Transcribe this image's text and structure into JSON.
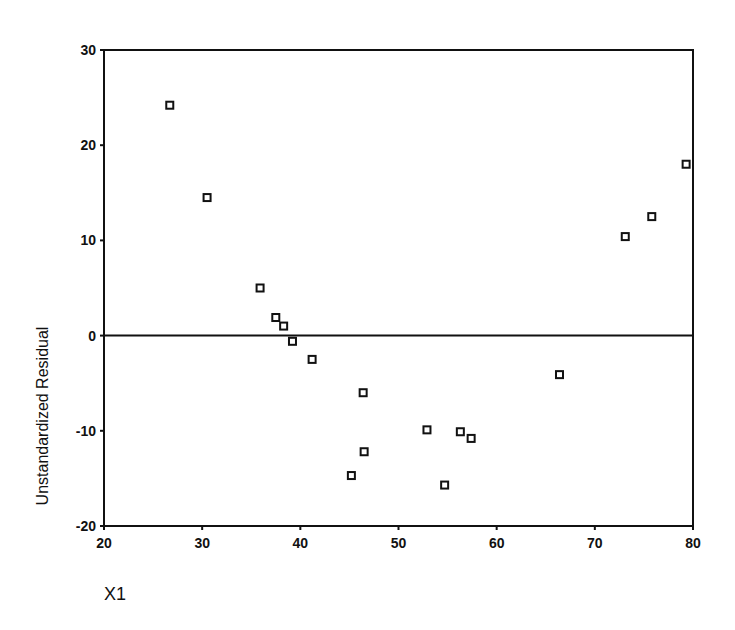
{
  "chart_data": {
    "type": "scatter",
    "title": "",
    "xlabel": "X1",
    "ylabel": "Unstandardized Residual",
    "xlim": [
      20,
      80
    ],
    "ylim": [
      -20,
      30
    ],
    "xticks": [
      20,
      30,
      40,
      50,
      60,
      70,
      80
    ],
    "yticks": [
      30,
      20,
      10,
      0,
      -10,
      -20
    ],
    "grid": false,
    "legend": null,
    "reference_line": {
      "y": 0
    },
    "marker": "hollow-square",
    "series": [
      {
        "name": "Residuals",
        "points": [
          {
            "x": 26.7,
            "y": 24.2
          },
          {
            "x": 30.5,
            "y": 14.5
          },
          {
            "x": 35.9,
            "y": 5.0
          },
          {
            "x": 37.5,
            "y": 1.9
          },
          {
            "x": 38.3,
            "y": 1.0
          },
          {
            "x": 39.2,
            "y": -0.6
          },
          {
            "x": 41.2,
            "y": -2.5
          },
          {
            "x": 45.2,
            "y": -14.7
          },
          {
            "x": 46.4,
            "y": -6.0
          },
          {
            "x": 46.5,
            "y": -12.2
          },
          {
            "x": 52.9,
            "y": -9.9
          },
          {
            "x": 54.7,
            "y": -15.7
          },
          {
            "x": 56.3,
            "y": -10.1
          },
          {
            "x": 57.4,
            "y": -10.8
          },
          {
            "x": 66.4,
            "y": -4.1
          },
          {
            "x": 73.1,
            "y": 10.4
          },
          {
            "x": 75.8,
            "y": 12.5
          },
          {
            "x": 79.3,
            "y": 18.0
          }
        ]
      }
    ]
  },
  "colors": {
    "axis": "#111111",
    "marker": "#111111",
    "background": "#ffffff"
  }
}
